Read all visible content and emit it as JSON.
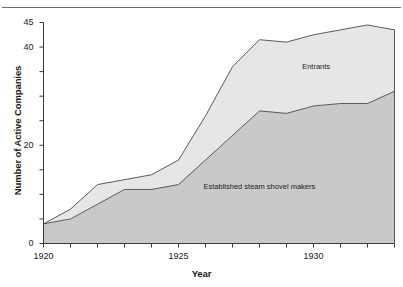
{
  "figure": {
    "header_fragment": "",
    "rule_color": "#6e6e6e"
  },
  "chart_data": {
    "type": "area",
    "stacked": true,
    "title": "",
    "subtitle": "",
    "xlabel": "Year",
    "ylabel": "Number of Active Companies",
    "xlim": [
      1920,
      1933
    ],
    "ylim": [
      0,
      45
    ],
    "grid": false,
    "legend_position": "inline-annotations",
    "y_ticks": [
      0,
      5,
      10,
      15,
      20,
      25,
      30,
      35,
      40,
      45
    ],
    "y_tick_labels": [
      "0",
      "",
      "",
      "",
      "20",
      "",
      "",
      "",
      "40",
      "45"
    ],
    "x_ticks": [
      1920,
      1921,
      1922,
      1923,
      1924,
      1925,
      1926,
      1927,
      1928,
      1929,
      1930,
      1931,
      1932,
      1933
    ],
    "x_tick_labels": [
      "1920",
      "",
      "",
      "",
      "",
      "1925",
      "",
      "",
      "",
      "",
      "1930",
      "",
      "",
      ""
    ],
    "x": [
      1920,
      1921,
      1922,
      1923,
      1924,
      1925,
      1926,
      1927,
      1928,
      1929,
      1930,
      1931,
      1932,
      1933
    ],
    "series": [
      {
        "name": "Established steam shovel makers",
        "color": "#c9c9c9",
        "values": [
          4,
          5,
          8,
          11,
          11,
          12,
          17,
          22,
          27,
          26.5,
          28,
          28.5,
          28.5,
          31
        ]
      },
      {
        "name": "Entrants",
        "color": "#e6e6e6",
        "values": [
          0,
          2,
          4,
          2,
          3,
          5,
          9,
          14,
          14.5,
          14.5,
          14.5,
          15,
          16,
          12.5
        ]
      }
    ],
    "totals": [
      4,
      7,
      12,
      13,
      14,
      17,
      26,
      36,
      41.5,
      41,
      42.5,
      43.5,
      44.5,
      43.5
    ],
    "annotations": [
      {
        "text": "Entrants",
        "x": 1930.1,
        "y": 36.0
      },
      {
        "text": "Established steam shovel makers",
        "x": 1928.0,
        "y": 11.5
      }
    ]
  }
}
